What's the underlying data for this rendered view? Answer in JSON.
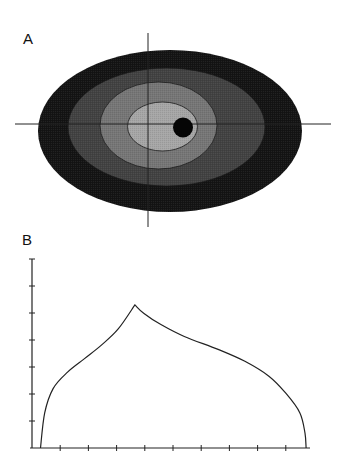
{
  "panels": {
    "a": {
      "label": "A"
    },
    "b": {
      "label": "B"
    }
  },
  "chart_data": [
    {
      "panel": "A",
      "type": "heatmap",
      "title": "",
      "description": "Nested filled ellipses (contour levels) centered near axis crosshair, darkest outer level to lightest inner level, with a small black dot right of center",
      "grid": false,
      "axes": {
        "horizontal": {
          "x1": 15,
          "x2": 331,
          "y": 124
        },
        "vertical": {
          "x": 148,
          "y1": 33,
          "y2": 227
        }
      },
      "levels": [
        {
          "level": 1,
          "fill": "#141414",
          "cx": 170,
          "cy": 131,
          "rx": 132,
          "ry": 81
        },
        {
          "level": 2,
          "fill": "#424242",
          "cx": 166.5,
          "cy": 127,
          "rx": 98.5,
          "ry": 59
        },
        {
          "level": 3,
          "fill": "#767676",
          "cx": 158.5,
          "cy": 125.5,
          "rx": 58.5,
          "ry": 43.5
        },
        {
          "level": 4,
          "fill": "#a6a6a6",
          "cx": 162.5,
          "cy": 126.5,
          "rx": 35,
          "ry": 24.5
        }
      ],
      "marker": {
        "shape": "circle",
        "fill": "#050505",
        "cx": 183,
        "cy": 127.5,
        "r": 10
      }
    },
    {
      "panel": "B",
      "type": "line",
      "title": "",
      "xlabel": "",
      "ylabel": "",
      "grid": false,
      "legend": null,
      "xlim": [
        0,
        10
      ],
      "ylim": [
        0,
        7
      ],
      "x_ticks": [
        0,
        1,
        2,
        3,
        4,
        5,
        6,
        7,
        8,
        9
      ],
      "y_ticks": [
        0,
        1,
        2,
        3,
        4,
        5,
        6,
        7
      ],
      "x_tick_labels": [],
      "y_tick_labels": [],
      "series": [
        {
          "name": "profile",
          "color": "#222222",
          "x": [
            0.3,
            0.45,
            0.75,
            1.25,
            1.85,
            2.45,
            3.05,
            3.65,
            3.97,
            4.57,
            5.4,
            6.6,
            7.55,
            8.4,
            9.0,
            9.5,
            9.68,
            9.72
          ],
          "y": [
            0.0,
            1.3,
            2.2,
            2.8,
            3.3,
            3.8,
            4.4,
            5.3,
            4.98,
            4.57,
            4.13,
            3.65,
            3.21,
            2.66,
            2.03,
            1.3,
            0.55,
            0.0
          ]
        }
      ],
      "annotations": [
        "cusp/peak at x≈3.65, y≈5.3"
      ]
    }
  ]
}
